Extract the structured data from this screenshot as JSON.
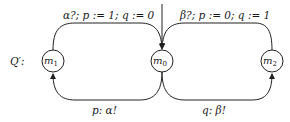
{
  "diagram": {
    "name_label": "Q′:",
    "nodes": [
      {
        "id": "m1",
        "base": "m",
        "sub": "1"
      },
      {
        "id": "m0",
        "base": "m",
        "sub": "0",
        "initial": true
      },
      {
        "id": "m2",
        "base": "m",
        "sub": "2"
      }
    ],
    "edges": [
      {
        "from": "m1",
        "to": "m0",
        "label": "α?; p := 1; q := 0"
      },
      {
        "from": "m2",
        "to": "m0",
        "label": "β?; p := 0; q := 1"
      },
      {
        "from": "m0",
        "to": "m1",
        "label": "p:  α!"
      },
      {
        "from": "m0",
        "to": "m2",
        "label": "q:  β!"
      }
    ]
  }
}
